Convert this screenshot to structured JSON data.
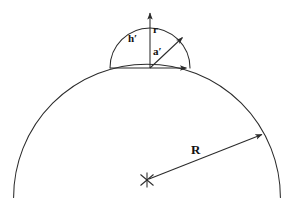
{
  "figure": {
    "background_color": "#ffffff",
    "line_color": "#2b2b2b",
    "label_color": "#111111",
    "labels": {
      "cap_height": "h′",
      "cap_radius": "r",
      "contact_radius": "a′",
      "substrate_radius": "R"
    },
    "shapes": {
      "large_arc": {
        "name": "substrate-arc",
        "center_x": 147,
        "center_y": 180,
        "radius": 133,
        "start_x": 12,
        "start_y": 197,
        "end_x": 283,
        "end_y": 197
      },
      "small_semicircle": {
        "name": "nucleus-cap-arc",
        "center_x": 150,
        "center_y": 68,
        "radius": 40,
        "left_x": 110,
        "left_y": 68,
        "right_x": 190,
        "right_y": 68,
        "apex_x": 150,
        "apex_y": 28
      }
    },
    "arrows": {
      "h_prime_arrow": {
        "name": "cap-height-arrow",
        "from_x": 150,
        "from_y": 68,
        "to_x": 150,
        "to_y": 9
      },
      "a_prime_arrow": {
        "name": "contact-radius-arrow",
        "from_x": 110,
        "from_y": 68,
        "to_x": 190,
        "to_y": 68
      },
      "r_arrow": {
        "name": "cap-radius-arrow",
        "from_x": 150,
        "from_y": 68,
        "to_x": 186,
        "to_y": 34
      },
      "R_arrow": {
        "name": "substrate-radius-arrow",
        "from_x": 147,
        "from_y": 180,
        "to_x": 266,
        "to_y": 132
      }
    },
    "center_marker": {
      "name": "substrate-center-cross",
      "x": 147,
      "y": 180,
      "size": 8
    }
  }
}
